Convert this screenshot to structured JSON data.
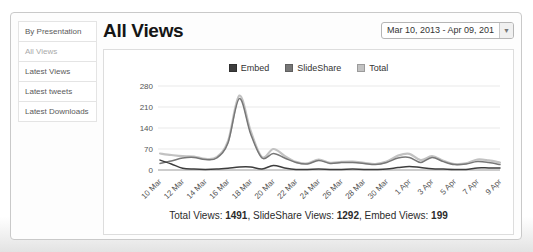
{
  "sidebar": {
    "items": [
      {
        "label": "By Presentation",
        "active": false
      },
      {
        "label": "All Views",
        "active": true
      },
      {
        "label": "Latest Views",
        "active": false
      },
      {
        "label": "Latest tweets",
        "active": false
      },
      {
        "label": "Latest Downloads",
        "active": false
      }
    ]
  },
  "header": {
    "title": "All Views",
    "date_range": {
      "label": "Mar 10, 2013 - Apr 09, 201",
      "arrow_icon": "▼"
    }
  },
  "summary": {
    "parts": [
      {
        "label": "Total Views: ",
        "value": "1491"
      },
      {
        "label": ", SlideShare Views: ",
        "value": "1292"
      },
      {
        "label": ", Embed Views: ",
        "value": "199"
      }
    ]
  },
  "chart_data": {
    "type": "line",
    "title": "",
    "xlabel": "",
    "ylabel": "",
    "categories": [
      "10 Mar",
      "11 Mar",
      "12 Mar",
      "13 Mar",
      "14 Mar",
      "15 Mar",
      "16 Mar",
      "17 Mar",
      "18 Mar",
      "19 Mar",
      "20 Mar",
      "21 Mar",
      "22 Mar",
      "23 Mar",
      "24 Mar",
      "25 Mar",
      "26 Mar",
      "27 Mar",
      "28 Mar",
      "29 Mar",
      "30 Mar",
      "31 Mar",
      "1 Apr",
      "2 Apr",
      "3 Apr",
      "4 Apr",
      "5 Apr",
      "6 Apr",
      "7 Apr",
      "8 Apr",
      "9 Apr"
    ],
    "xtick_every": 2,
    "ylim": [
      0,
      280
    ],
    "yticks": [
      0,
      70,
      140,
      210,
      280
    ],
    "grid": true,
    "legend_position": "top",
    "series": [
      {
        "name": "Embed",
        "color": "#3d3d3d",
        "values": [
          33,
          20,
          6,
          3,
          2,
          3,
          6,
          10,
          10,
          3,
          15,
          7,
          2,
          2,
          3,
          2,
          2,
          3,
          2,
          2,
          3,
          8,
          12,
          8,
          4,
          3,
          2,
          2,
          7,
          7,
          7
        ]
      },
      {
        "name": "SlideShare",
        "color": "#777777",
        "values": [
          22,
          30,
          40,
          42,
          35,
          40,
          90,
          238,
          120,
          40,
          55,
          40,
          25,
          20,
          32,
          22,
          25,
          25,
          22,
          18,
          25,
          40,
          42,
          25,
          42,
          28,
          18,
          20,
          28,
          25,
          18
        ]
      },
      {
        "name": "Total",
        "color": "#c2c2c2",
        "values": [
          55,
          50,
          46,
          45,
          37,
          43,
          96,
          248,
          130,
          43,
          70,
          47,
          27,
          22,
          35,
          24,
          27,
          28,
          24,
          20,
          28,
          48,
          54,
          33,
          46,
          31,
          20,
          22,
          35,
          32,
          25
        ]
      }
    ]
  }
}
